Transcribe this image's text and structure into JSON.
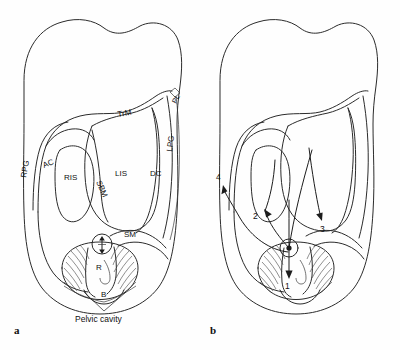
{
  "figure": {
    "background_color": "#fefefe",
    "line_color": "#2b2b2b",
    "panels": [
      {
        "id": "a",
        "letter": "a",
        "labels": [
          {
            "key": "rpg",
            "text": "RPG",
            "meaning": "right paracolic gutter",
            "x": 26,
            "y": 175,
            "rotation": -80
          },
          {
            "key": "ac",
            "text": "AC",
            "meaning": "ascending colon",
            "x": 48,
            "y": 166,
            "rotation": -20
          },
          {
            "key": "ris",
            "text": "RIS",
            "meaning": "right infracolic space",
            "x": 72,
            "y": 178,
            "rotation": 0
          },
          {
            "key": "sbm",
            "text": "SBM",
            "meaning": "small bowel mesentery",
            "x": 97,
            "y": 190,
            "rotation": -65
          },
          {
            "key": "lis",
            "text": "LIS",
            "meaning": "left infracolic space",
            "x": 124,
            "y": 172,
            "rotation": 0
          },
          {
            "key": "dc",
            "text": "DC",
            "meaning": "descending colon",
            "x": 156,
            "y": 172,
            "rotation": 0
          },
          {
            "key": "lpg",
            "text": "LPG",
            "meaning": "left paracolic gutter",
            "x": 172,
            "y": 145,
            "rotation": -82
          },
          {
            "key": "trm",
            "text": "TrM",
            "meaning": "transverse mesocolon",
            "x": 128,
            "y": 114,
            "rotation": -8
          },
          {
            "key": "pl",
            "text": "PL",
            "meaning": "phrenicocolic ligament",
            "x": 178,
            "y": 101,
            "rotation": -62
          },
          {
            "key": "sm",
            "text": "SM",
            "meaning": "sigmoid mesocolon",
            "x": 130,
            "y": 235,
            "rotation": 0
          },
          {
            "key": "r",
            "text": "R",
            "meaning": "rectum",
            "x": 99,
            "y": 268,
            "rotation": 0
          },
          {
            "key": "b",
            "text": "B",
            "meaning": "bladder",
            "x": 106,
            "y": 294,
            "rotation": 0
          }
        ],
        "callout": {
          "text": "Pelvic cavity",
          "x": 110,
          "y": 316
        },
        "uterus_marker": {
          "symbol": "arrows-vertical-icon",
          "x": 102,
          "y": 244
        }
      },
      {
        "id": "b",
        "letter": "b",
        "flow_numbers": [
          {
            "key": "1",
            "text": "1",
            "x": 88,
            "y": 281,
            "direction": "down",
            "meaning": "spread into pelvic cavity"
          },
          {
            "key": "2",
            "text": "2",
            "x": 59,
            "y": 216,
            "direction": "up-left",
            "meaning": "spread to right infracolic space"
          },
          {
            "key": "3",
            "text": "3",
            "x": 125,
            "y": 228,
            "direction": "down-right",
            "meaning": "spread to left infracolic space"
          },
          {
            "key": "4",
            "text": "4",
            "x": 23,
            "y": 177,
            "direction": "up",
            "meaning": "spread up right paracolic gutter"
          }
        ],
        "origin_marker": {
          "symbol": "primary-site-icon",
          "x": 93,
          "y": 248
        }
      }
    ]
  }
}
